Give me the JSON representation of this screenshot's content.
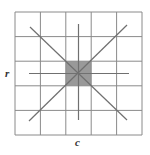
{
  "diagram": {
    "type": "grid-neighborhood",
    "grid": {
      "rows": 5,
      "cols": 5,
      "x0": 15,
      "y0": 12,
      "cell_w": 25.4,
      "cell_h": 24.6,
      "line_color": "#8a8a8a"
    },
    "highlight_cell": {
      "row": 2,
      "col": 2,
      "color": "#999999"
    },
    "center": {
      "x": 78.5,
      "y": 73.5
    },
    "rays": {
      "color": "#707070",
      "lines": [
        {
          "name": "diagonal-main",
          "x1": 30,
          "y1": 27,
          "x2": 127,
          "y2": 120
        },
        {
          "name": "diagonal-anti",
          "x1": 127,
          "y1": 25,
          "x2": 29,
          "y2": 121
        },
        {
          "name": "vertical",
          "x1": 78.5,
          "y1": 24,
          "x2": 78.5,
          "y2": 120
        },
        {
          "name": "horizontal",
          "x1": 29,
          "y1": 73.5,
          "x2": 129,
          "y2": 73.5
        }
      ]
    },
    "labels": {
      "row_label": "r",
      "col_label": "c"
    }
  }
}
